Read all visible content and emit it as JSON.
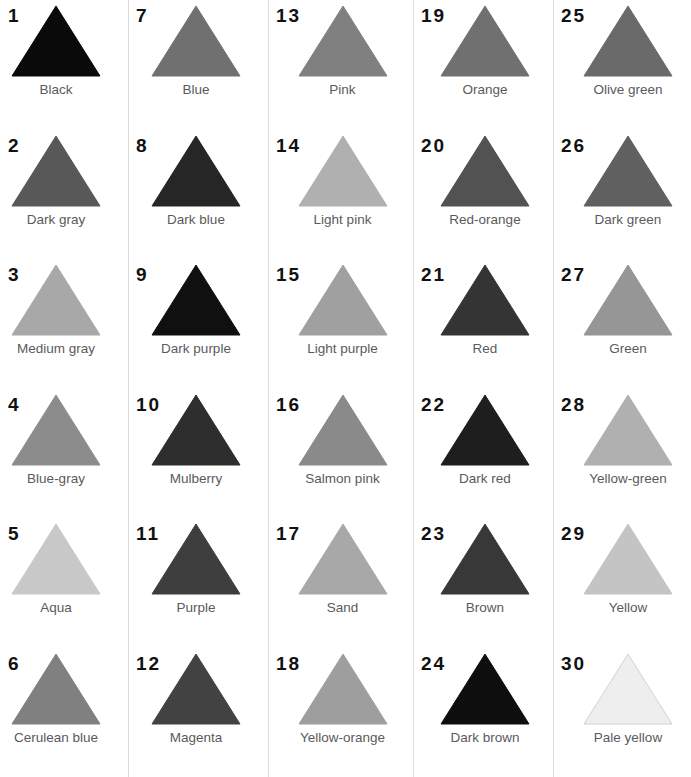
{
  "chart_data": {
    "type": "table",
    "title": "",
    "subtitle": "",
    "xlabel": "",
    "ylabel": "",
    "layout": {
      "columns": 5,
      "rows": 6,
      "order": "column-major",
      "grid": false,
      "legend": "none",
      "dividers": "thin vertical rules between columns",
      "marker_shape": "triangle",
      "background": "#ffffff",
      "index_color": "#111111",
      "label_color": "#5a5a5c",
      "divider_color": "#dcdcdc"
    },
    "categories": [
      "Black",
      "Dark gray",
      "Medium gray",
      "Blue-gray",
      "Aqua",
      "Cerulean blue",
      "Blue",
      "Dark blue",
      "Dark purple",
      "Mulberry",
      "Purple",
      "Magenta",
      "Pink",
      "Light pink",
      "Light purple",
      "Salmon pink",
      "Sand",
      "Yellow-orange",
      "Orange",
      "Red-orange",
      "Red",
      "Dark red",
      "Brown",
      "Dark brown",
      "Olive green",
      "Dark green",
      "Green",
      "Yellow-green",
      "Yellow",
      "Pale yellow"
    ],
    "values": [
      10,
      88,
      168,
      140,
      200,
      128,
      112,
      38,
      16,
      46,
      62,
      66,
      128,
      176,
      160,
      138,
      168,
      158,
      112,
      82,
      52,
      30,
      56,
      14,
      106,
      96,
      150,
      176,
      196,
      238
    ],
    "value_note": "rendered grayscale level (0-255) of each triangle swatch"
  },
  "swatches": [
    {
      "index": "1",
      "name": "Black",
      "fill": "#0a0a0a",
      "stroke": "#0a0a0a"
    },
    {
      "index": "2",
      "name": "Dark gray",
      "fill": "#585858",
      "stroke": "#585858"
    },
    {
      "index": "3",
      "name": "Medium gray",
      "fill": "#a8a8a8",
      "stroke": "#a8a8a8"
    },
    {
      "index": "4",
      "name": "Blue-gray",
      "fill": "#8c8c8c",
      "stroke": "#8c8c8c"
    },
    {
      "index": "5",
      "name": "Aqua",
      "fill": "#c8c8c8",
      "stroke": "#c8c8c8"
    },
    {
      "index": "6",
      "name": "Cerulean blue",
      "fill": "#808080",
      "stroke": "#808080"
    },
    {
      "index": "7",
      "name": "Blue",
      "fill": "#707070",
      "stroke": "#707070"
    },
    {
      "index": "8",
      "name": "Dark blue",
      "fill": "#262626",
      "stroke": "#262626"
    },
    {
      "index": "9",
      "name": "Dark purple",
      "fill": "#101010",
      "stroke": "#101010"
    },
    {
      "index": "10",
      "name": "Mulberry",
      "fill": "#2e2e2e",
      "stroke": "#2e2e2e"
    },
    {
      "index": "11",
      "name": "Purple",
      "fill": "#3e3e3e",
      "stroke": "#3e3e3e"
    },
    {
      "index": "12",
      "name": "Magenta",
      "fill": "#424242",
      "stroke": "#424242"
    },
    {
      "index": "13",
      "name": "Pink",
      "fill": "#808080",
      "stroke": "#808080"
    },
    {
      "index": "14",
      "name": "Light pink",
      "fill": "#b0b0b0",
      "stroke": "#b0b0b0"
    },
    {
      "index": "15",
      "name": "Light purple",
      "fill": "#a0a0a0",
      "stroke": "#a0a0a0"
    },
    {
      "index": "16",
      "name": "Salmon pink",
      "fill": "#8a8a8a",
      "stroke": "#8a8a8a"
    },
    {
      "index": "17",
      "name": "Sand",
      "fill": "#a8a8a8",
      "stroke": "#a8a8a8"
    },
    {
      "index": "18",
      "name": "Yellow-orange",
      "fill": "#9e9e9e",
      "stroke": "#9e9e9e"
    },
    {
      "index": "19",
      "name": "Orange",
      "fill": "#707070",
      "stroke": "#707070"
    },
    {
      "index": "20",
      "name": "Red-orange",
      "fill": "#525252",
      "stroke": "#525252"
    },
    {
      "index": "21",
      "name": "Red",
      "fill": "#343434",
      "stroke": "#343434"
    },
    {
      "index": "22",
      "name": "Dark red",
      "fill": "#1e1e1e",
      "stroke": "#1e1e1e"
    },
    {
      "index": "23",
      "name": "Brown",
      "fill": "#383838",
      "stroke": "#383838"
    },
    {
      "index": "24",
      "name": "Dark brown",
      "fill": "#0e0e0e",
      "stroke": "#0e0e0e"
    },
    {
      "index": "25",
      "name": "Olive green",
      "fill": "#6a6a6a",
      "stroke": "#6a6a6a"
    },
    {
      "index": "26",
      "name": "Dark green",
      "fill": "#606060",
      "stroke": "#606060"
    },
    {
      "index": "27",
      "name": "Green",
      "fill": "#969696",
      "stroke": "#969696"
    },
    {
      "index": "28",
      "name": "Yellow-green",
      "fill": "#b0b0b0",
      "stroke": "#b0b0b0"
    },
    {
      "index": "29",
      "name": "Yellow",
      "fill": "#c4c4c4",
      "stroke": "#c4c4c4"
    },
    {
      "index": "30",
      "name": "Pale yellow",
      "fill": "#eeeeee",
      "stroke": "#d2d2d2"
    }
  ]
}
